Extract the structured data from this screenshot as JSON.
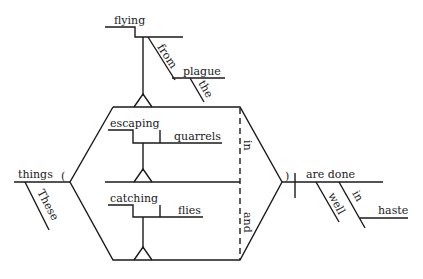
{
  "diagram": {
    "type": "Reed-Kellogg sentence diagram",
    "sentence_words": {
      "subject": "things",
      "subject_modifier": "These",
      "participle_top": "flying",
      "prep_top": "from",
      "object_top": "plague",
      "article_top": "the",
      "participle_1": "escaping",
      "object_1": "quarrels",
      "participle_2": "catching",
      "object_2": "flies",
      "conj_dashed_1": "in",
      "conj_dashed_2": "and",
      "verb": "are done",
      "adverb": "well",
      "prep_right": "in",
      "object_right": "haste",
      "paren_left": "(",
      "paren_right": ")"
    }
  }
}
